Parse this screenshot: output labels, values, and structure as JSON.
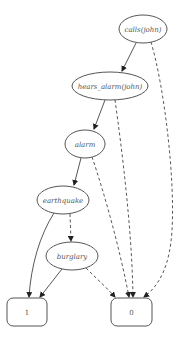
{
  "diagram": {
    "type": "binary decision diagram",
    "nodes": [
      {
        "id": "calls_john",
        "label": "calls(john)",
        "shape": "ellipse",
        "cx": 143,
        "cy": 29,
        "rx": 24,
        "ry": 14
      },
      {
        "id": "hears_alarm_john",
        "label": "hears_alarm(john)",
        "shape": "ellipse",
        "cx": 110,
        "cy": 86,
        "rx": 38,
        "ry": 14
      },
      {
        "id": "alarm",
        "label": "alarm",
        "shape": "ellipse",
        "cx": 85,
        "cy": 144,
        "rx": 20,
        "ry": 14
      },
      {
        "id": "earthquake",
        "label": "earthquake",
        "shape": "ellipse",
        "cx": 63,
        "cy": 200,
        "rx": 26,
        "ry": 14
      },
      {
        "id": "burglary",
        "label": "burglary",
        "shape": "ellipse",
        "cx": 72,
        "cy": 256,
        "rx": 26,
        "ry": 14
      },
      {
        "id": "one",
        "label": "1",
        "shape": "box",
        "x": 7,
        "y": 298,
        "w": 40,
        "h": 28
      },
      {
        "id": "zero",
        "label": "0",
        "shape": "box",
        "x": 111,
        "y": 298,
        "w": 41,
        "h": 28
      }
    ],
    "edges": [
      {
        "from": "calls_john",
        "to": "hears_alarm_john",
        "style": "solid"
      },
      {
        "from": "calls_john",
        "to": "zero",
        "style": "dashed"
      },
      {
        "from": "hears_alarm_john",
        "to": "alarm",
        "style": "solid"
      },
      {
        "from": "hears_alarm_john",
        "to": "zero",
        "style": "dashed"
      },
      {
        "from": "alarm",
        "to": "earthquake",
        "style": "solid"
      },
      {
        "from": "alarm",
        "to": "zero",
        "style": "dashed"
      },
      {
        "from": "earthquake",
        "to": "one",
        "style": "solid"
      },
      {
        "from": "earthquake",
        "to": "burglary",
        "style": "dashed"
      },
      {
        "from": "burglary",
        "to": "one",
        "style": "solid"
      },
      {
        "from": "burglary",
        "to": "zero",
        "style": "dashed"
      }
    ],
    "labels": {
      "calls_john": "calls(john)",
      "hears_alarm_john": "hears_alarm(john)",
      "alarm": "alarm",
      "earthquake": "earthquake",
      "burglary": "burglary",
      "one": "1",
      "zero": "0"
    }
  },
  "colors": {
    "stroke": "#555555",
    "edge": "#444444",
    "background": "#ffffff"
  }
}
